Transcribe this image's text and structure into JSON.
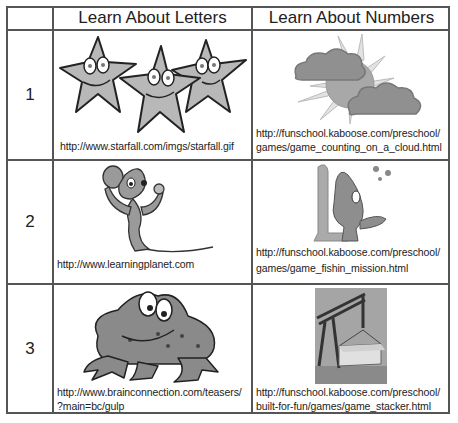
{
  "table": {
    "headers": [
      "",
      "Learn About Letters",
      "Learn About Numbers"
    ],
    "rows": [
      {
        "number": "1",
        "letters": {
          "image": "smiling-stars",
          "url": "http://www.starfall.com/imgs/starfall.gif"
        },
        "numbers": {
          "image": "sun-and-clouds",
          "url_line1": "http://funschool.kaboose.com/preschool/",
          "url_line2": "games/game_counting_on_a_cloud.html"
        }
      },
      {
        "number": "2",
        "letters": {
          "image": "cartoon-mouse",
          "url": "http://www.learningplanet.com"
        },
        "numbers": {
          "image": "cartoon-fish-with-number-one",
          "url_line1": "http://funschool.kaboose.com/preschool/",
          "url_line2": "games/game_fishin_mission.html"
        }
      },
      {
        "number": "3",
        "letters": {
          "image": "cartoon-frog",
          "url_line1": "http://www.brainconnection.com/teasers/",
          "url_line2": "?main=bc/gulp"
        },
        "numbers": {
          "image": "crane-photo",
          "url_line1": "http://funschool.kaboose.com/preschool/",
          "url_line2": "built-for-fun/games/game_stacker.html"
        }
      }
    ]
  },
  "colors": {
    "border": "#555555",
    "illustration_fill": "#b8b8b8",
    "illustration_dark": "#8a8a8a",
    "text": "#222222"
  }
}
